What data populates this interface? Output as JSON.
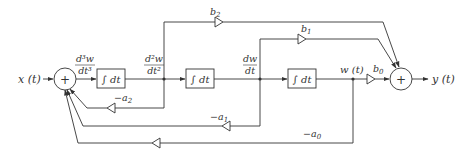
{
  "diagram": {
    "input": {
      "label": "x (t)"
    },
    "output": {
      "label": "y (t)"
    },
    "summers": [
      {
        "id": "sum-left",
        "symbol": "+"
      },
      {
        "id": "sum-right",
        "symbol": "+"
      }
    ],
    "integrators": [
      {
        "id": "int-1",
        "label": "∫ dt"
      },
      {
        "id": "int-2",
        "label": "∫ dt"
      },
      {
        "id": "int-3",
        "label": "∫ dt"
      }
    ],
    "signals": {
      "d3w": {
        "num": "d³w",
        "den": "dt³"
      },
      "d2w": {
        "num": "d²w",
        "den": "dt²"
      },
      "dw": {
        "num": "dw",
        "den": "dt"
      },
      "w": {
        "label": "w (t)"
      }
    },
    "gains": {
      "b2": {
        "label": "b",
        "sub": "2"
      },
      "b1": {
        "label": "b",
        "sub": "1"
      },
      "b0": {
        "label": "b",
        "sub": "0"
      },
      "a2": {
        "label": "−a",
        "sub": "2"
      },
      "a1": {
        "label": "−a",
        "sub": "1"
      },
      "a0": {
        "label": "−a",
        "sub": "0"
      }
    },
    "colors": {
      "stroke": "#333333",
      "background": "#ffffff"
    }
  }
}
